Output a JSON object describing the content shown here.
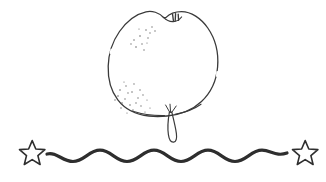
{
  "page": {
    "title": "Fruit Line Drawing with Wavy Divider",
    "background_color": "#ffffff",
    "width": 326,
    "height": 182
  },
  "artwork": {
    "style": "hand-drawn black-and-white line art (coloring page)",
    "ink_color": "#3a3a3a",
    "wave_ink_color": "#2e2e2e",
    "stipple_color": "#6b6b6b",
    "fill_color": "#ffffff",
    "subject_label": "quince fruit",
    "elements": [
      {
        "name": "fruit-body",
        "description": "rounded apple/quince shaped fruit outline with a notched dimple at the top",
        "stroke_width": 1.3,
        "bbox": [
          108,
          10,
          120,
          112
        ]
      },
      {
        "name": "fruit-top-notch-mark",
        "description": "tiny w-shaped calyx mark inside the top dimple",
        "stroke_width": 1.4,
        "bbox": [
          172,
          14,
          10,
          8
        ]
      },
      {
        "name": "fruit-stem",
        "description": "thin elongated stem looping down from the base of the fruit",
        "stroke_width": 1.2,
        "bbox": [
          162,
          104,
          16,
          40
        ]
      },
      {
        "name": "fruit-stipple-upper-left",
        "description": "scattered shading dots in the upper-left of the fruit",
        "dot_count": 13
      },
      {
        "name": "fruit-stipple-lower-left",
        "description": "scattered shading dots in the lower-left of the fruit",
        "dot_count": 22
      },
      {
        "name": "wavy-divider-line",
        "description": "thick horizontal sine wave divider across the lower part of the page",
        "stroke_width": 3.2,
        "wave_count": 6,
        "amplitude": 6,
        "baseline_y": 156,
        "x_start": 47,
        "x_end": 288
      },
      {
        "name": "star-left",
        "description": "hollow five-pointed hand-drawn star at the left end of the divider",
        "stroke_width": 1.6,
        "center": [
          32,
          153
        ],
        "radius": 13,
        "rotation_deg": -14
      },
      {
        "name": "star-right",
        "description": "hollow five-pointed hand-drawn star at the right end of the divider",
        "stroke_width": 1.6,
        "center": [
          305,
          153
        ],
        "radius": 13,
        "rotation_deg": 10
      }
    ]
  },
  "stipple_dots": {
    "upper_left": [
      [
        146,
        30
      ],
      [
        152,
        27
      ],
      [
        140,
        36
      ],
      [
        148,
        38
      ],
      [
        134,
        40
      ],
      [
        142,
        44
      ],
      [
        150,
        33
      ],
      [
        136,
        47
      ],
      [
        144,
        50
      ],
      [
        131,
        44
      ],
      [
        155,
        31
      ],
      [
        139,
        29
      ],
      [
        147,
        43
      ]
    ],
    "lower_left": [
      [
        120,
        90
      ],
      [
        126,
        86
      ],
      [
        132,
        92
      ],
      [
        118,
        96
      ],
      [
        125,
        99
      ],
      [
        134,
        84
      ],
      [
        140,
        90
      ],
      [
        122,
        103
      ],
      [
        130,
        105
      ],
      [
        138,
        98
      ],
      [
        115,
        100
      ],
      [
        128,
        93
      ],
      [
        136,
        103
      ],
      [
        143,
        95
      ],
      [
        121,
        108
      ],
      [
        133,
        110
      ],
      [
        127,
        113
      ],
      [
        141,
        106
      ],
      [
        147,
        100
      ],
      [
        124,
        82
      ],
      [
        150,
        108
      ],
      [
        145,
        112
      ]
    ]
  }
}
